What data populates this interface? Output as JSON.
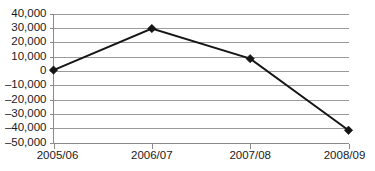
{
  "chart_data": {
    "type": "line",
    "title": "",
    "subtitle": "",
    "xlabel": "",
    "ylabel": "",
    "categories": [
      "2005/06",
      "2006/07",
      "2007/08",
      "2008/09"
    ],
    "values": [
      500,
      29500,
      8500,
      -41500
    ],
    "series": [
      {
        "name": "",
        "values": [
          500,
          29500,
          8500,
          -41500
        ]
      }
    ],
    "ylim": [
      -50000,
      40000
    ],
    "ytick_values": [
      40000,
      30000,
      20000,
      10000,
      0,
      -10000,
      -20000,
      -30000,
      -40000,
      -50000
    ],
    "ytick_labels": [
      "40,000",
      "30,000",
      "20,000",
      "10,000",
      "0",
      "–10,000",
      "–20,000",
      "–30,000",
      "–40,000",
      "–50,000"
    ],
    "xtick_labels": [
      "2005/06",
      "2006/07",
      "2007/08",
      "2008/09"
    ],
    "grid": true,
    "grid_axis": "y",
    "legend": false,
    "legend_position": "none",
    "marker": "diamond",
    "line_color": "#151515",
    "marker_color": "#151515",
    "grid_color": "#9a9a9a",
    "axis_color": "#8a8a8a",
    "text_color": "#1a1a1a",
    "background_color": "#ffffff"
  },
  "axis": {
    "y_labels": [
      {
        "text": "40,000",
        "value": 40000
      },
      {
        "text": "30,000",
        "value": 30000
      },
      {
        "text": "20,000",
        "value": 20000
      },
      {
        "text": "10,000",
        "value": 10000
      },
      {
        "text": "0",
        "value": 0
      },
      {
        "text": "–10,000",
        "value": -10000
      },
      {
        "text": "–20,000",
        "value": -20000
      },
      {
        "text": "–30,000",
        "value": -30000
      },
      {
        "text": "–40,000",
        "value": -40000
      },
      {
        "text": "–50,000",
        "value": -50000
      }
    ],
    "x_labels": [
      {
        "text": "2005/06"
      },
      {
        "text": "2006/07"
      },
      {
        "text": "2007/08"
      },
      {
        "text": "2008/09"
      }
    ]
  }
}
